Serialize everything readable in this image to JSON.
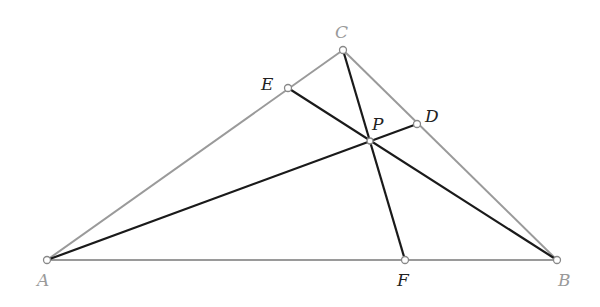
{
  "diagram": {
    "type": "triangle-cevians",
    "colors": {
      "triangle_side": "#9a9a9a",
      "cevian": "#1a1a1a",
      "point_fill": "#ffffff",
      "point_stroke": "#888888"
    },
    "points": {
      "A": {
        "label": "A",
        "x": 47,
        "y": 260
      },
      "B": {
        "label": "B",
        "x": 557,
        "y": 260
      },
      "C": {
        "label": "C",
        "x": 343,
        "y": 50
      },
      "D": {
        "label": "D",
        "x": 417,
        "y": 124
      },
      "E": {
        "label": "E",
        "x": 288,
        "y": 88
      },
      "F": {
        "label": "F",
        "x": 405,
        "y": 260
      },
      "P": {
        "label": "P",
        "x": 370,
        "y": 141
      }
    },
    "sides": [
      [
        "A",
        "B"
      ],
      [
        "B",
        "C"
      ],
      [
        "C",
        "A"
      ]
    ],
    "cevians": [
      [
        "A",
        "D"
      ],
      [
        "B",
        "E"
      ],
      [
        "C",
        "F"
      ]
    ]
  }
}
